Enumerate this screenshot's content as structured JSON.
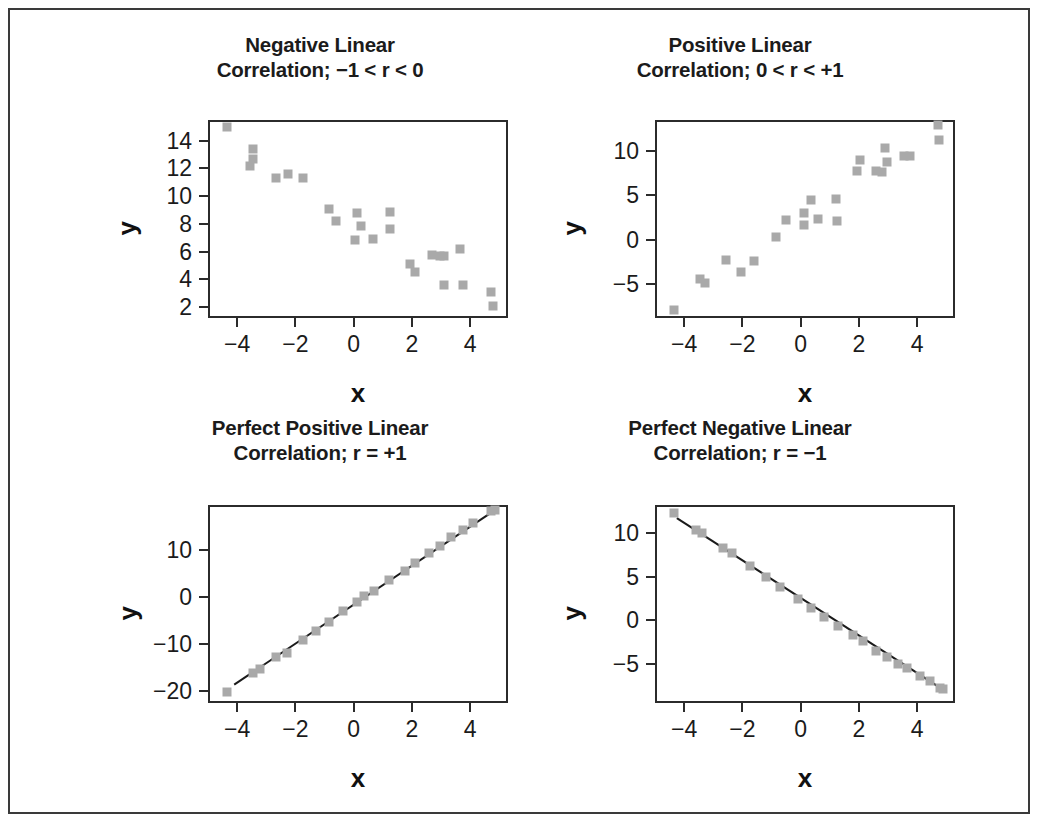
{
  "figure": {
    "background_color": "#ffffff",
    "border_color": "#3a3a3a",
    "marker_color": "#a9a9a9",
    "line_color": "#1a1a1a",
    "axis_color": "#2b2b2b",
    "bottom_cut_text": ""
  },
  "panels": [
    {
      "id": "negative-linear",
      "title_line1": "Negative Linear",
      "title_line2": "Correlation; −1 < r < 0",
      "xlabel": "x",
      "ylabel": "y"
    },
    {
      "id": "positive-linear",
      "title_line1": "Positive Linear",
      "title_line2": "Correlation; 0 < r < +1",
      "xlabel": "x",
      "ylabel": "y"
    },
    {
      "id": "perfect-positive-linear",
      "title_line1": "Perfect Positive Linear",
      "title_line2": "Correlation; r = +1",
      "xlabel": "x",
      "ylabel": "y"
    },
    {
      "id": "perfect-negative-linear",
      "title_line1": "Perfect Negative Linear",
      "title_line2": "Correlation; r = −1",
      "xlabel": "x",
      "ylabel": "y"
    }
  ],
  "chart_data": [
    {
      "type": "scatter",
      "id": "negative-linear",
      "title": "Negative Linear Correlation; −1 < r < 0",
      "xlabel": "x",
      "ylabel": "y",
      "xlim": [
        -5.0,
        5.3
      ],
      "ylim": [
        1.2,
        15.5
      ],
      "xticks": [
        -4,
        -2,
        0,
        2,
        4
      ],
      "xtick_labels": [
        "−4",
        "−2",
        "0",
        "2",
        "4"
      ],
      "yticks": [
        2,
        4,
        6,
        8,
        10,
        12,
        14
      ],
      "ytick_labels": [
        "2",
        "4",
        "6",
        "8",
        "10",
        "12",
        "14"
      ],
      "grid": false,
      "legend": null,
      "fit_line": false,
      "points": [
        {
          "x": -4.35,
          "y": 15.0
        },
        {
          "x": -3.45,
          "y": 13.4
        },
        {
          "x": -3.45,
          "y": 12.7
        },
        {
          "x": -3.55,
          "y": 12.2
        },
        {
          "x": -2.65,
          "y": 11.3
        },
        {
          "x": -2.25,
          "y": 11.6
        },
        {
          "x": -1.75,
          "y": 11.3
        },
        {
          "x": -0.85,
          "y": 9.05
        },
        {
          "x": -0.6,
          "y": 8.2
        },
        {
          "x": 0.1,
          "y": 8.8
        },
        {
          "x": 0.25,
          "y": 7.85
        },
        {
          "x": 0.05,
          "y": 6.85
        },
        {
          "x": 0.65,
          "y": 6.9
        },
        {
          "x": 1.25,
          "y": 8.85
        },
        {
          "x": 1.25,
          "y": 7.65
        },
        {
          "x": 1.95,
          "y": 5.1
        },
        {
          "x": 2.1,
          "y": 4.5
        },
        {
          "x": 2.7,
          "y": 5.75
        },
        {
          "x": 2.95,
          "y": 5.65
        },
        {
          "x": 3.1,
          "y": 5.65
        },
        {
          "x": 3.1,
          "y": 3.6
        },
        {
          "x": 3.65,
          "y": 6.2
        },
        {
          "x": 3.75,
          "y": 3.6
        },
        {
          "x": 4.7,
          "y": 3.05
        },
        {
          "x": 4.8,
          "y": 2.05
        }
      ]
    },
    {
      "type": "scatter",
      "id": "positive-linear",
      "title": "Positive Linear Correlation; 0 < r < +1",
      "xlabel": "x",
      "ylabel": "y",
      "xlim": [
        -5.0,
        5.3
      ],
      "ylim": [
        -8.8,
        13.5
      ],
      "xticks": [
        -4,
        -2,
        0,
        2,
        4
      ],
      "xtick_labels": [
        "−4",
        "−2",
        "0",
        "2",
        "4"
      ],
      "yticks": [
        -5,
        0,
        5,
        10
      ],
      "ytick_labels": [
        "−5",
        "0",
        "5",
        "10"
      ],
      "grid": false,
      "legend": null,
      "fit_line": false,
      "points": [
        {
          "x": -4.35,
          "y": -7.9
        },
        {
          "x": -3.45,
          "y": -4.4
        },
        {
          "x": -3.3,
          "y": -4.9
        },
        {
          "x": -2.55,
          "y": -2.3
        },
        {
          "x": -2.05,
          "y": -3.6
        },
        {
          "x": -1.6,
          "y": -2.4
        },
        {
          "x": -0.85,
          "y": 0.3
        },
        {
          "x": -0.5,
          "y": 2.2
        },
        {
          "x": 0.1,
          "y": 3.0
        },
        {
          "x": 0.1,
          "y": 1.7
        },
        {
          "x": 0.35,
          "y": 4.5
        },
        {
          "x": 0.6,
          "y": 2.4
        },
        {
          "x": 1.2,
          "y": 4.6
        },
        {
          "x": 1.25,
          "y": 2.1
        },
        {
          "x": 1.95,
          "y": 7.8
        },
        {
          "x": 2.05,
          "y": 9.0
        },
        {
          "x": 2.6,
          "y": 7.7
        },
        {
          "x": 2.8,
          "y": 7.6
        },
        {
          "x": 2.9,
          "y": 10.3
        },
        {
          "x": 2.95,
          "y": 8.8
        },
        {
          "x": 3.55,
          "y": 9.4
        },
        {
          "x": 3.75,
          "y": 9.5
        },
        {
          "x": 4.7,
          "y": 12.9
        },
        {
          "x": 4.75,
          "y": 11.3
        }
      ]
    },
    {
      "type": "scatter",
      "id": "perfect-positive-linear",
      "title": "Perfect Positive Linear Correlation; r = +1",
      "xlabel": "x",
      "ylabel": "y",
      "xlim": [
        -5.0,
        5.3
      ],
      "ylim": [
        -22.5,
        19.5
      ],
      "xticks": [
        -4,
        -2,
        0,
        2,
        4
      ],
      "xtick_labels": [
        "−4",
        "−2",
        "0",
        "2",
        "4"
      ],
      "yticks": [
        -20,
        -10,
        0,
        10
      ],
      "ytick_labels": [
        "−20",
        "−10",
        "0",
        "10"
      ],
      "grid": false,
      "legend": null,
      "fit_line": true,
      "fit_line_from": {
        "x": -4.1,
        "y": -18.6
      },
      "fit_line_to": {
        "x": 4.85,
        "y": 18.4
      },
      "points": [
        {
          "x": -4.35,
          "y": -20.2
        },
        {
          "x": -3.45,
          "y": -16.2
        },
        {
          "x": -3.2,
          "y": -15.3
        },
        {
          "x": -2.65,
          "y": -12.7
        },
        {
          "x": -2.3,
          "y": -11.9
        },
        {
          "x": -1.75,
          "y": -9.2
        },
        {
          "x": -1.3,
          "y": -7.3
        },
        {
          "x": -0.85,
          "y": -5.4
        },
        {
          "x": -0.35,
          "y": -2.9
        },
        {
          "x": 0.1,
          "y": -1.1
        },
        {
          "x": 0.35,
          "y": 0.1
        },
        {
          "x": 0.7,
          "y": 1.3
        },
        {
          "x": 1.2,
          "y": 3.6
        },
        {
          "x": 1.75,
          "y": 5.5
        },
        {
          "x": 2.1,
          "y": 7.3
        },
        {
          "x": 2.6,
          "y": 9.4
        },
        {
          "x": 2.95,
          "y": 10.9
        },
        {
          "x": 3.35,
          "y": 12.7
        },
        {
          "x": 3.75,
          "y": 14.2
        },
        {
          "x": 4.1,
          "y": 15.6
        },
        {
          "x": 4.7,
          "y": 18.2
        },
        {
          "x": 4.85,
          "y": 18.5
        }
      ]
    },
    {
      "type": "scatter",
      "id": "perfect-negative-linear",
      "title": "Perfect Negative Linear Correlation; r = −1",
      "xlabel": "x",
      "ylabel": "y",
      "xlim": [
        -5.0,
        5.3
      ],
      "ylim": [
        -9.5,
        13.2
      ],
      "xticks": [
        -4,
        -2,
        0,
        2,
        4
      ],
      "xtick_labels": [
        "−4",
        "−2",
        "0",
        "2",
        "4"
      ],
      "yticks": [
        -5,
        0,
        5,
        10
      ],
      "ytick_labels": [
        "−5",
        "0",
        "5",
        "10"
      ],
      "grid": false,
      "legend": null,
      "fit_line": true,
      "fit_line_from": {
        "x": -4.25,
        "y": 11.7
      },
      "fit_line_to": {
        "x": 4.9,
        "y": -8.0
      },
      "points": [
        {
          "x": -4.35,
          "y": 12.3
        },
        {
          "x": -3.6,
          "y": 10.3
        },
        {
          "x": -3.4,
          "y": 10.0
        },
        {
          "x": -2.65,
          "y": 8.3
        },
        {
          "x": -2.35,
          "y": 7.7
        },
        {
          "x": -1.75,
          "y": 6.2
        },
        {
          "x": -1.2,
          "y": 4.9
        },
        {
          "x": -0.7,
          "y": 3.8
        },
        {
          "x": -0.1,
          "y": 2.4
        },
        {
          "x": 0.35,
          "y": 1.4
        },
        {
          "x": 0.8,
          "y": 0.4
        },
        {
          "x": 1.3,
          "y": -0.7
        },
        {
          "x": 1.8,
          "y": -1.7
        },
        {
          "x": 2.15,
          "y": -2.4
        },
        {
          "x": 2.6,
          "y": -3.5
        },
        {
          "x": 2.95,
          "y": -4.2
        },
        {
          "x": 3.35,
          "y": -5.0
        },
        {
          "x": 3.65,
          "y": -5.5
        },
        {
          "x": 4.1,
          "y": -6.4
        },
        {
          "x": 4.45,
          "y": -7.0
        },
        {
          "x": 4.8,
          "y": -7.8
        },
        {
          "x": 4.9,
          "y": -7.9
        }
      ]
    }
  ]
}
